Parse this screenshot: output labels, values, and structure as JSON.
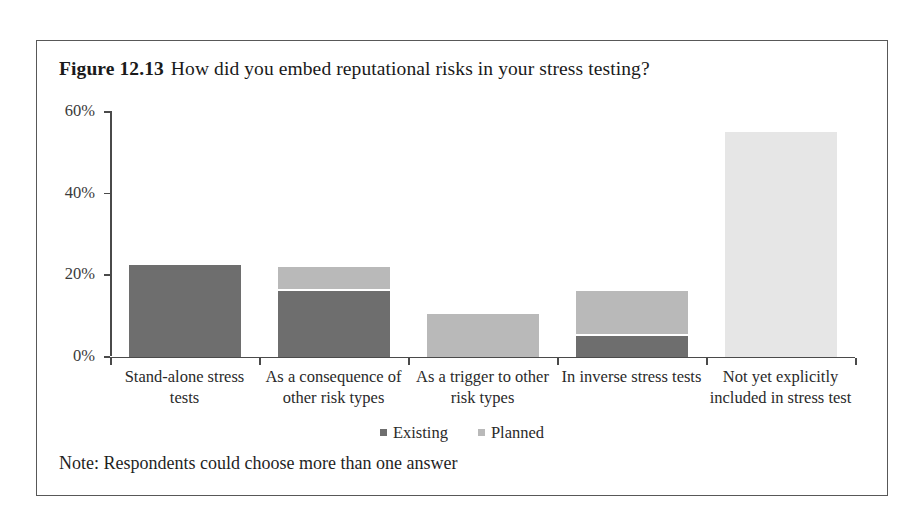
{
  "figure": {
    "label": "Figure 12.13",
    "question": "How did you embed reputational risks in your stress testing?",
    "note": "Note: Respondents could choose more than one answer"
  },
  "legend": {
    "items": [
      {
        "label": "Existing",
        "color": "#6e6e6e"
      },
      {
        "label": "Planned",
        "color": "#b9b9b9"
      }
    ]
  },
  "chart_data": {
    "type": "bar",
    "subtitle": "",
    "xlabel": "",
    "ylabel": "",
    "stacked": true,
    "grid": false,
    "legend_position": "bottom-center",
    "ylim": [
      0,
      60
    ],
    "ytick_labels": [
      "0%",
      "20%",
      "40%",
      "60%"
    ],
    "ytick_values": [
      0,
      20,
      40,
      60
    ],
    "categories": [
      "Stand-alone stress tests",
      "As a consequence of other risk types",
      "As a trigger to other risk types",
      "In inverse stress tests",
      "Not yet explicitly included in stress test"
    ],
    "series": [
      {
        "name": "Existing",
        "color": "#6e6e6e",
        "values": [
          22.5,
          16,
          0,
          5,
          0
        ]
      },
      {
        "name": "Planned",
        "color": "#b9b9b9",
        "values": [
          0,
          6,
          10.5,
          11,
          55
        ]
      }
    ],
    "annotations": [
      "Note: Respondents could choose more than one answer"
    ]
  }
}
